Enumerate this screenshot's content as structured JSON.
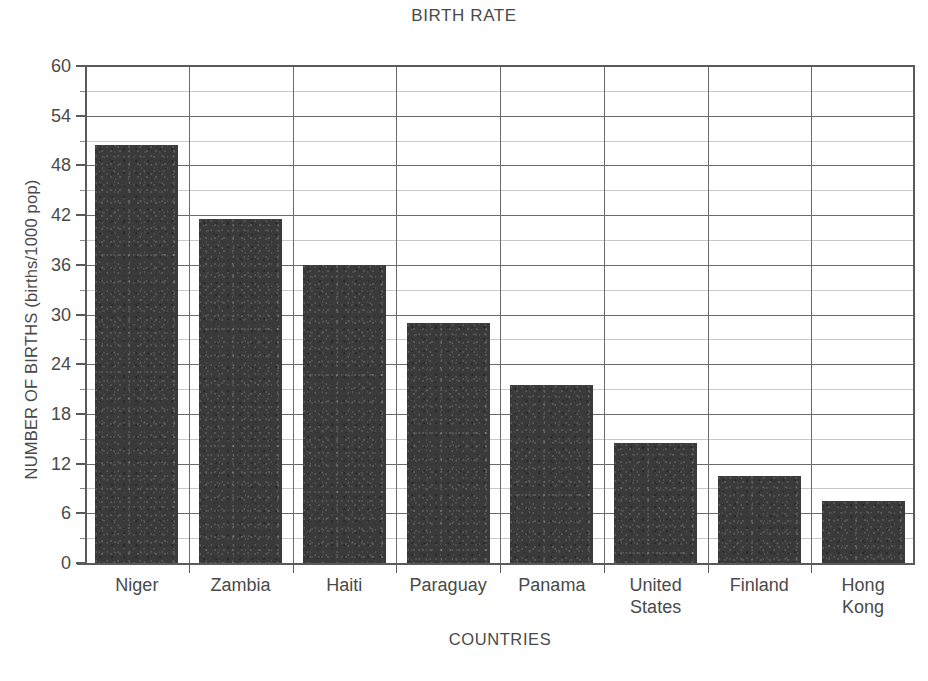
{
  "chart_data": {
    "type": "bar",
    "title": "BIRTH RATE",
    "xlabel": "COUNTRIES",
    "ylabel": "NUMBER OF BIRTHS (births/1000 pop)",
    "categories": [
      "Niger",
      "Zambia",
      "Haiti",
      "Paraguay",
      "Panama",
      "United States",
      "Finland",
      "Hong Kong"
    ],
    "category_lines": [
      [
        "Niger"
      ],
      [
        "Zambia"
      ],
      [
        "Haiti"
      ],
      [
        "Paraguay"
      ],
      [
        "Panama"
      ],
      [
        "United",
        "States"
      ],
      [
        "Finland"
      ],
      [
        "Hong",
        "Kong"
      ]
    ],
    "values": [
      50.5,
      41.5,
      36.0,
      29.0,
      21.5,
      14.5,
      10.5,
      7.5
    ],
    "ylim": [
      0,
      60
    ],
    "ytick_major": [
      0,
      6,
      12,
      18,
      24,
      30,
      36,
      42,
      48,
      54,
      60
    ],
    "ytick_minor": [
      3,
      9,
      15,
      21,
      27,
      33,
      39,
      45,
      51,
      57
    ],
    "grid": "major horizontal, minor horizontal, vertical category separators",
    "legend": "none",
    "bar_color": "#3a3a3a",
    "grid_color": "#6b6b6b",
    "minor_grid_color": "#c9c9c9",
    "axis_color": "#5a5a5a",
    "text_color": "#4a4a4a"
  }
}
